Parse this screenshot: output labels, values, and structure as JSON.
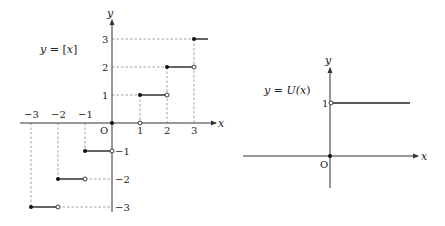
{
  "graphs": [
    {
      "id": "floor",
      "label": "y = [x]",
      "label_parts": {
        "y": "y",
        "eq": " = ",
        "lb": "[",
        "x": "x",
        "rb": "]"
      },
      "axis_labels": {
        "x": "x",
        "y": "y",
        "origin": "O"
      },
      "x_ticks": [
        "-3",
        "-2",
        "-1",
        "1",
        "2",
        "3"
      ],
      "y_ticks": [
        "1",
        "2",
        "3",
        "-1",
        "-2",
        "-3"
      ],
      "steps": [
        {
          "from": -3,
          "to": -2,
          "y": -3
        },
        {
          "from": -2,
          "to": -1,
          "y": -2
        },
        {
          "from": -1,
          "to": 0,
          "y": -1
        },
        {
          "from": 0,
          "to": 1,
          "y": 0
        },
        {
          "from": 1,
          "to": 2,
          "y": 1
        },
        {
          "from": 2,
          "to": 3,
          "y": 2
        },
        {
          "from": 3,
          "to": 3.4,
          "y": 3
        }
      ]
    },
    {
      "id": "unit-step",
      "label": "y = U(x)",
      "label_parts": {
        "y": "y",
        "eq": " = ",
        "fn": "U(",
        "x": "x",
        "rp": ")"
      },
      "axis_labels": {
        "x": "x",
        "y": "y",
        "origin": "O"
      },
      "y_ticks": [
        "1"
      ],
      "pieces": [
        {
          "from": "-inf",
          "to": 0,
          "y": 0,
          "closed_end": "right-at-origin"
        },
        {
          "from": 0,
          "to": "inf",
          "y": 1,
          "open_start": true
        }
      ]
    }
  ],
  "colors": {
    "axis": "#333333",
    "curve": "#222222",
    "dash": "#888888"
  }
}
